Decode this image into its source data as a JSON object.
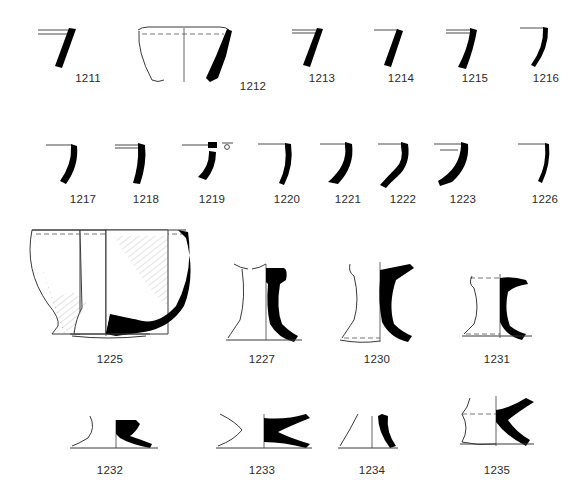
{
  "plate": {
    "background_color": "#ffffff",
    "ink_color": "#000000",
    "outline_color": "#3a3a3a",
    "label_color": "#2b2b2b",
    "width": 586,
    "height": 501
  },
  "rows": [
    {
      "name": "row-rim-sherds-upper",
      "figures": [
        {
          "id": "1211",
          "label": "1211",
          "label_x": 88,
          "label_y": 72,
          "type": "rim-sherd"
        },
        {
          "id": "1212",
          "label": "1212",
          "label_x": 253,
          "label_y": 80,
          "type": "vessel-profile"
        },
        {
          "id": "1213",
          "label": "1213",
          "label_x": 322,
          "label_y": 72,
          "type": "rim-sherd"
        },
        {
          "id": "1214",
          "label": "1214",
          "label_x": 401,
          "label_y": 72,
          "type": "rim-sherd"
        },
        {
          "id": "1215",
          "label": "1215",
          "label_x": 475,
          "label_y": 72,
          "type": "rim-sherd"
        },
        {
          "id": "1216",
          "label": "1216",
          "label_x": 546,
          "label_y": 72,
          "type": "rim-sherd"
        }
      ]
    },
    {
      "name": "row-rim-sherds-lower",
      "figures": [
        {
          "id": "1217",
          "label": "1217",
          "label_x": 83,
          "label_y": 193,
          "type": "rim-sherd"
        },
        {
          "id": "1218",
          "label": "1218",
          "label_x": 146,
          "label_y": 193,
          "type": "rim-sherd"
        },
        {
          "id": "1219",
          "label": "1219",
          "label_x": 212,
          "label_y": 193,
          "type": "rim-sherd",
          "detail": "small-circle-mark"
        },
        {
          "id": "1220",
          "label": "1220",
          "label_x": 287,
          "label_y": 193,
          "type": "rim-sherd"
        },
        {
          "id": "1221",
          "label": "1221",
          "label_x": 348,
          "label_y": 193,
          "type": "rim-sherd"
        },
        {
          "id": "1222",
          "label": "1222",
          "label_x": 403,
          "label_y": 193,
          "type": "rim-sherd"
        },
        {
          "id": "1223",
          "label": "1223",
          "label_x": 463,
          "label_y": 193,
          "type": "rim-sherd"
        },
        {
          "id": "1226",
          "label": "1226",
          "label_x": 545,
          "label_y": 193,
          "type": "rim-sherd"
        }
      ]
    },
    {
      "name": "row-vessel-and-pedestals",
      "figures": [
        {
          "id": "1225",
          "label": "1225",
          "label_x": 110,
          "label_y": 353,
          "type": "complete-vessel"
        },
        {
          "id": "1227",
          "label": "1227",
          "label_x": 262,
          "label_y": 353,
          "type": "pedestal-foot"
        },
        {
          "id": "1230",
          "label": "1230",
          "label_x": 377,
          "label_y": 353,
          "type": "pedestal-foot"
        },
        {
          "id": "1231",
          "label": "1231",
          "label_x": 497,
          "label_y": 353,
          "type": "pedestal-foot"
        }
      ]
    },
    {
      "name": "row-bases",
      "figures": [
        {
          "id": "1232",
          "label": "1232",
          "label_x": 110,
          "label_y": 464,
          "type": "ring-base"
        },
        {
          "id": "1233",
          "label": "1233",
          "label_x": 262,
          "label_y": 464,
          "type": "ring-base"
        },
        {
          "id": "1234",
          "label": "1234",
          "label_x": 372,
          "label_y": 464,
          "type": "ring-base"
        },
        {
          "id": "1235",
          "label": "1235",
          "label_x": 497,
          "label_y": 464,
          "type": "pedestal-base"
        }
      ]
    }
  ]
}
